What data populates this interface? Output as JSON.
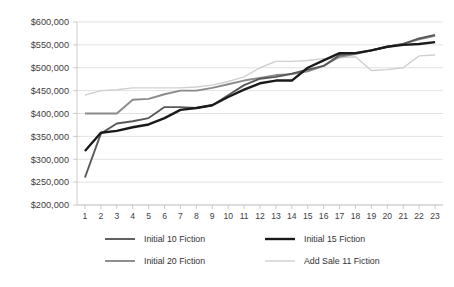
{
  "chart_data": {
    "type": "line",
    "title": "",
    "subtitle": "",
    "xlabel": "",
    "ylabel": "",
    "ylim": [
      200000,
      600000
    ],
    "ytick_step": 50000,
    "ytick_labels": [
      "$600,000",
      "$550,000",
      "$500,000",
      "$450,000",
      "$400,000",
      "$350,000",
      "$300,000",
      "$250,000",
      "$200,000"
    ],
    "ytick_values": [
      600000,
      550000,
      500000,
      450000,
      400000,
      350000,
      300000,
      250000,
      200000
    ],
    "grid": true,
    "grid_axis": "y",
    "legend_position": "bottom",
    "categories": [
      1,
      2,
      3,
      4,
      5,
      6,
      7,
      8,
      9,
      10,
      11,
      12,
      13,
      14,
      15,
      16,
      17,
      18,
      19,
      20,
      21,
      22,
      23
    ],
    "xtick_labels": [
      "1",
      "2",
      "3",
      "4",
      "5",
      "6",
      "7",
      "8",
      "9",
      "10",
      "11",
      "12",
      "13",
      "14",
      "15",
      "16",
      "17",
      "18",
      "19",
      "20",
      "21",
      "22",
      "23"
    ],
    "series": [
      {
        "name": "Initial 10 Fiction",
        "color": "#595959",
        "width": 1.9,
        "values": [
          260000,
          356000,
          378000,
          383000,
          390000,
          414000,
          414000,
          412000,
          418000,
          440000,
          462000,
          476000,
          480000,
          487000,
          496000,
          504000,
          528000,
          532000,
          538000,
          546000,
          552000,
          564000,
          572000
        ]
      },
      {
        "name": "Initial  15 Fiction",
        "color": "#1a1a1a",
        "width": 2.4,
        "values": [
          318000,
          358000,
          362000,
          370000,
          376000,
          390000,
          408000,
          412000,
          418000,
          436000,
          452000,
          466000,
          472000,
          472000,
          500000,
          516000,
          532000,
          532000,
          538000,
          546000,
          550000,
          552000,
          556000
        ]
      },
      {
        "name": "Initial 20 Fiction",
        "color": "#8a8a8a",
        "width": 1.9,
        "values": [
          400000,
          400000,
          400000,
          430000,
          432000,
          442000,
          450000,
          450000,
          456000,
          464000,
          472000,
          478000,
          484000,
          486000,
          492000,
          504000,
          524000,
          530000,
          538000,
          546000,
          552000,
          562000,
          570000
        ]
      },
      {
        "name": "Add Sale 11 Fiction",
        "color": "#cfcfcf",
        "width": 1.4,
        "values": [
          440000,
          450000,
          452000,
          456000,
          456000,
          456000,
          456000,
          458000,
          462000,
          470000,
          480000,
          500000,
          514000,
          514000,
          516000,
          520000,
          522000,
          524000,
          494000,
          496000,
          500000,
          526000,
          528000
        ]
      }
    ]
  },
  "legend": {
    "entries": [
      {
        "label": "Initial 10 Fiction"
      },
      {
        "label": "Initial  15 Fiction"
      },
      {
        "label": "Initial 20 Fiction"
      },
      {
        "label": "Add Sale 11 Fiction"
      }
    ]
  }
}
